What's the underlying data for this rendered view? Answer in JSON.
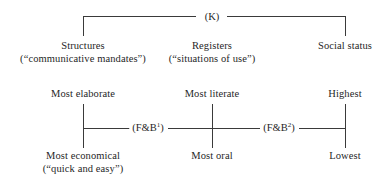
{
  "figure": {
    "top_bracket": {
      "tag": "(K)"
    },
    "top_row": [
      {
        "name": "structures",
        "title": "Structures",
        "gloss": "(“communicative mandates”)"
      },
      {
        "name": "registers",
        "title": "Registers",
        "gloss": "(“situations of use”)"
      },
      {
        "name": "social-status",
        "title": "Social status",
        "gloss": ""
      }
    ],
    "scales": [
      {
        "name": "elaboration",
        "top": "Most elaborate",
        "bottom": "Most economical",
        "bottom_gloss": "(“quick and easy”)"
      },
      {
        "name": "literacy",
        "top": "Most literate",
        "bottom": "Most oral",
        "bottom_gloss": ""
      },
      {
        "name": "status",
        "top": "Highest",
        "bottom": "Lowest",
        "bottom_gloss": ""
      }
    ],
    "connectors": [
      {
        "name": "fb1",
        "label_pre": "(F&B",
        "label_sup": "1",
        "label_post": ")"
      },
      {
        "name": "fb2",
        "label_pre": "(F&B",
        "label_sup": "2",
        "label_post": ")"
      }
    ],
    "colors": {
      "line": "#3a3a3a",
      "text": "#1f1f1f",
      "background": "#ffffff"
    }
  }
}
